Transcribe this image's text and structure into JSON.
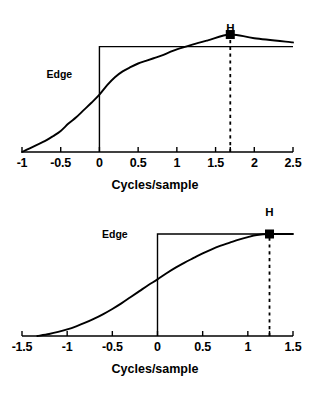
{
  "chart_data": [
    {
      "id": "top",
      "type": "line",
      "title": "",
      "xlabel": "Cycles/sample",
      "ylabel": "",
      "xlim": [
        -1,
        2.5
      ],
      "ylim": [
        0,
        1.12
      ],
      "xticks": [
        -1,
        -0.5,
        0,
        0.5,
        1,
        1.5,
        2,
        2.5
      ],
      "xticklabels": [
        "-1",
        "-0.5",
        "0",
        "0.5",
        "1",
        "1.5",
        "2",
        "2.5"
      ],
      "grid": false,
      "legend": "none",
      "annotations": [
        {
          "name": "edge-label",
          "text": "Edge",
          "x": -0.27,
          "y": 0.74
        },
        {
          "name": "h-label",
          "text": "H",
          "x": 1.69,
          "y": 1.1
        }
      ],
      "series": [
        {
          "name": "edge-step",
          "style": "solid",
          "x": [
            0,
            0,
            2.5
          ],
          "values": [
            0,
            1.0,
            1.0
          ]
        },
        {
          "name": "mtf-curve",
          "style": "solid",
          "x": [
            -1,
            -0.9,
            -0.8,
            -0.7,
            -0.6,
            -0.5,
            -0.4,
            -0.3,
            -0.2,
            -0.1,
            0,
            0.1,
            0.2,
            0.3,
            0.4,
            0.5,
            0.6,
            0.7,
            0.8,
            0.9,
            1.0,
            1.2,
            1.4,
            1.69,
            2.0,
            2.5
          ],
          "values": [
            0.0,
            0.035,
            0.07,
            0.105,
            0.15,
            0.2,
            0.27,
            0.33,
            0.4,
            0.47,
            0.545,
            0.635,
            0.71,
            0.765,
            0.805,
            0.84,
            0.865,
            0.89,
            0.915,
            0.945,
            0.975,
            1.02,
            1.06,
            1.115,
            1.08,
            1.04
          ]
        },
        {
          "name": "h-dropline",
          "style": "dashed",
          "x": [
            1.69,
            1.69
          ],
          "values": [
            0,
            1.115
          ]
        }
      ],
      "markers": [
        {
          "name": "h-marker",
          "shape": "square",
          "x": 1.69,
          "y": 1.115
        }
      ]
    },
    {
      "id": "bottom",
      "type": "line",
      "title": "",
      "xlabel": "Cycles/sample",
      "ylabel": "",
      "xlim": [
        -1.5,
        1.5
      ],
      "ylim": [
        0,
        1.0
      ],
      "xticks": [
        -1.5,
        -1,
        -0.5,
        0,
        0.5,
        1,
        1.5
      ],
      "xticklabels": [
        "-1.5",
        "-1",
        "-0.5",
        "0",
        "0.5",
        "1",
        "1.5"
      ],
      "grid": false,
      "legend": "none",
      "annotations": [
        {
          "name": "edge-label",
          "text": "Edge",
          "x": -0.26,
          "y": 1.0
        },
        {
          "name": "h-label",
          "text": "H",
          "x": 1.24,
          "y": 1.14
        }
      ],
      "series": [
        {
          "name": "edge-step",
          "style": "solid",
          "x": [
            0,
            0,
            1.5
          ],
          "values": [
            0,
            1.0,
            1.0
          ]
        },
        {
          "name": "mtf-curve",
          "style": "solid",
          "x": [
            -1.33,
            -1.2,
            -1.1,
            -1.0,
            -0.9,
            -0.8,
            -0.7,
            -0.6,
            -0.5,
            -0.4,
            -0.3,
            -0.2,
            -0.1,
            0,
            0.1,
            0.2,
            0.3,
            0.4,
            0.5,
            0.6,
            0.7,
            0.8,
            0.9,
            1.0,
            1.1,
            1.24,
            1.5
          ],
          "values": [
            0.0,
            0.02,
            0.04,
            0.065,
            0.095,
            0.13,
            0.17,
            0.215,
            0.265,
            0.32,
            0.38,
            0.44,
            0.5,
            0.555,
            0.615,
            0.67,
            0.72,
            0.765,
            0.81,
            0.85,
            0.885,
            0.915,
            0.945,
            0.97,
            0.99,
            1.0,
            1.0
          ]
        },
        {
          "name": "h-dropline",
          "style": "dashed",
          "x": [
            1.24,
            1.24
          ],
          "values": [
            0,
            1.0
          ]
        }
      ],
      "markers": [
        {
          "name": "h-marker",
          "shape": "square",
          "x": 1.24,
          "y": 1.0
        }
      ]
    }
  ],
  "top_chart": {
    "xlabel": "Cycles/sample",
    "edge_label": "Edge",
    "h_label": "H",
    "xticklabels": [
      "-1",
      "-0.5",
      "0",
      "0.5",
      "1",
      "1.5",
      "2",
      "2.5"
    ]
  },
  "bottom_chart": {
    "xlabel": "Cycles/sample",
    "edge_label": "Edge",
    "h_label": "H",
    "xticklabels": [
      "-1.5",
      "-1",
      "-0.5",
      "0",
      "0.5",
      "1",
      "1.5"
    ]
  },
  "colors": {
    "ink": "#000000",
    "background": "#ffffff"
  }
}
